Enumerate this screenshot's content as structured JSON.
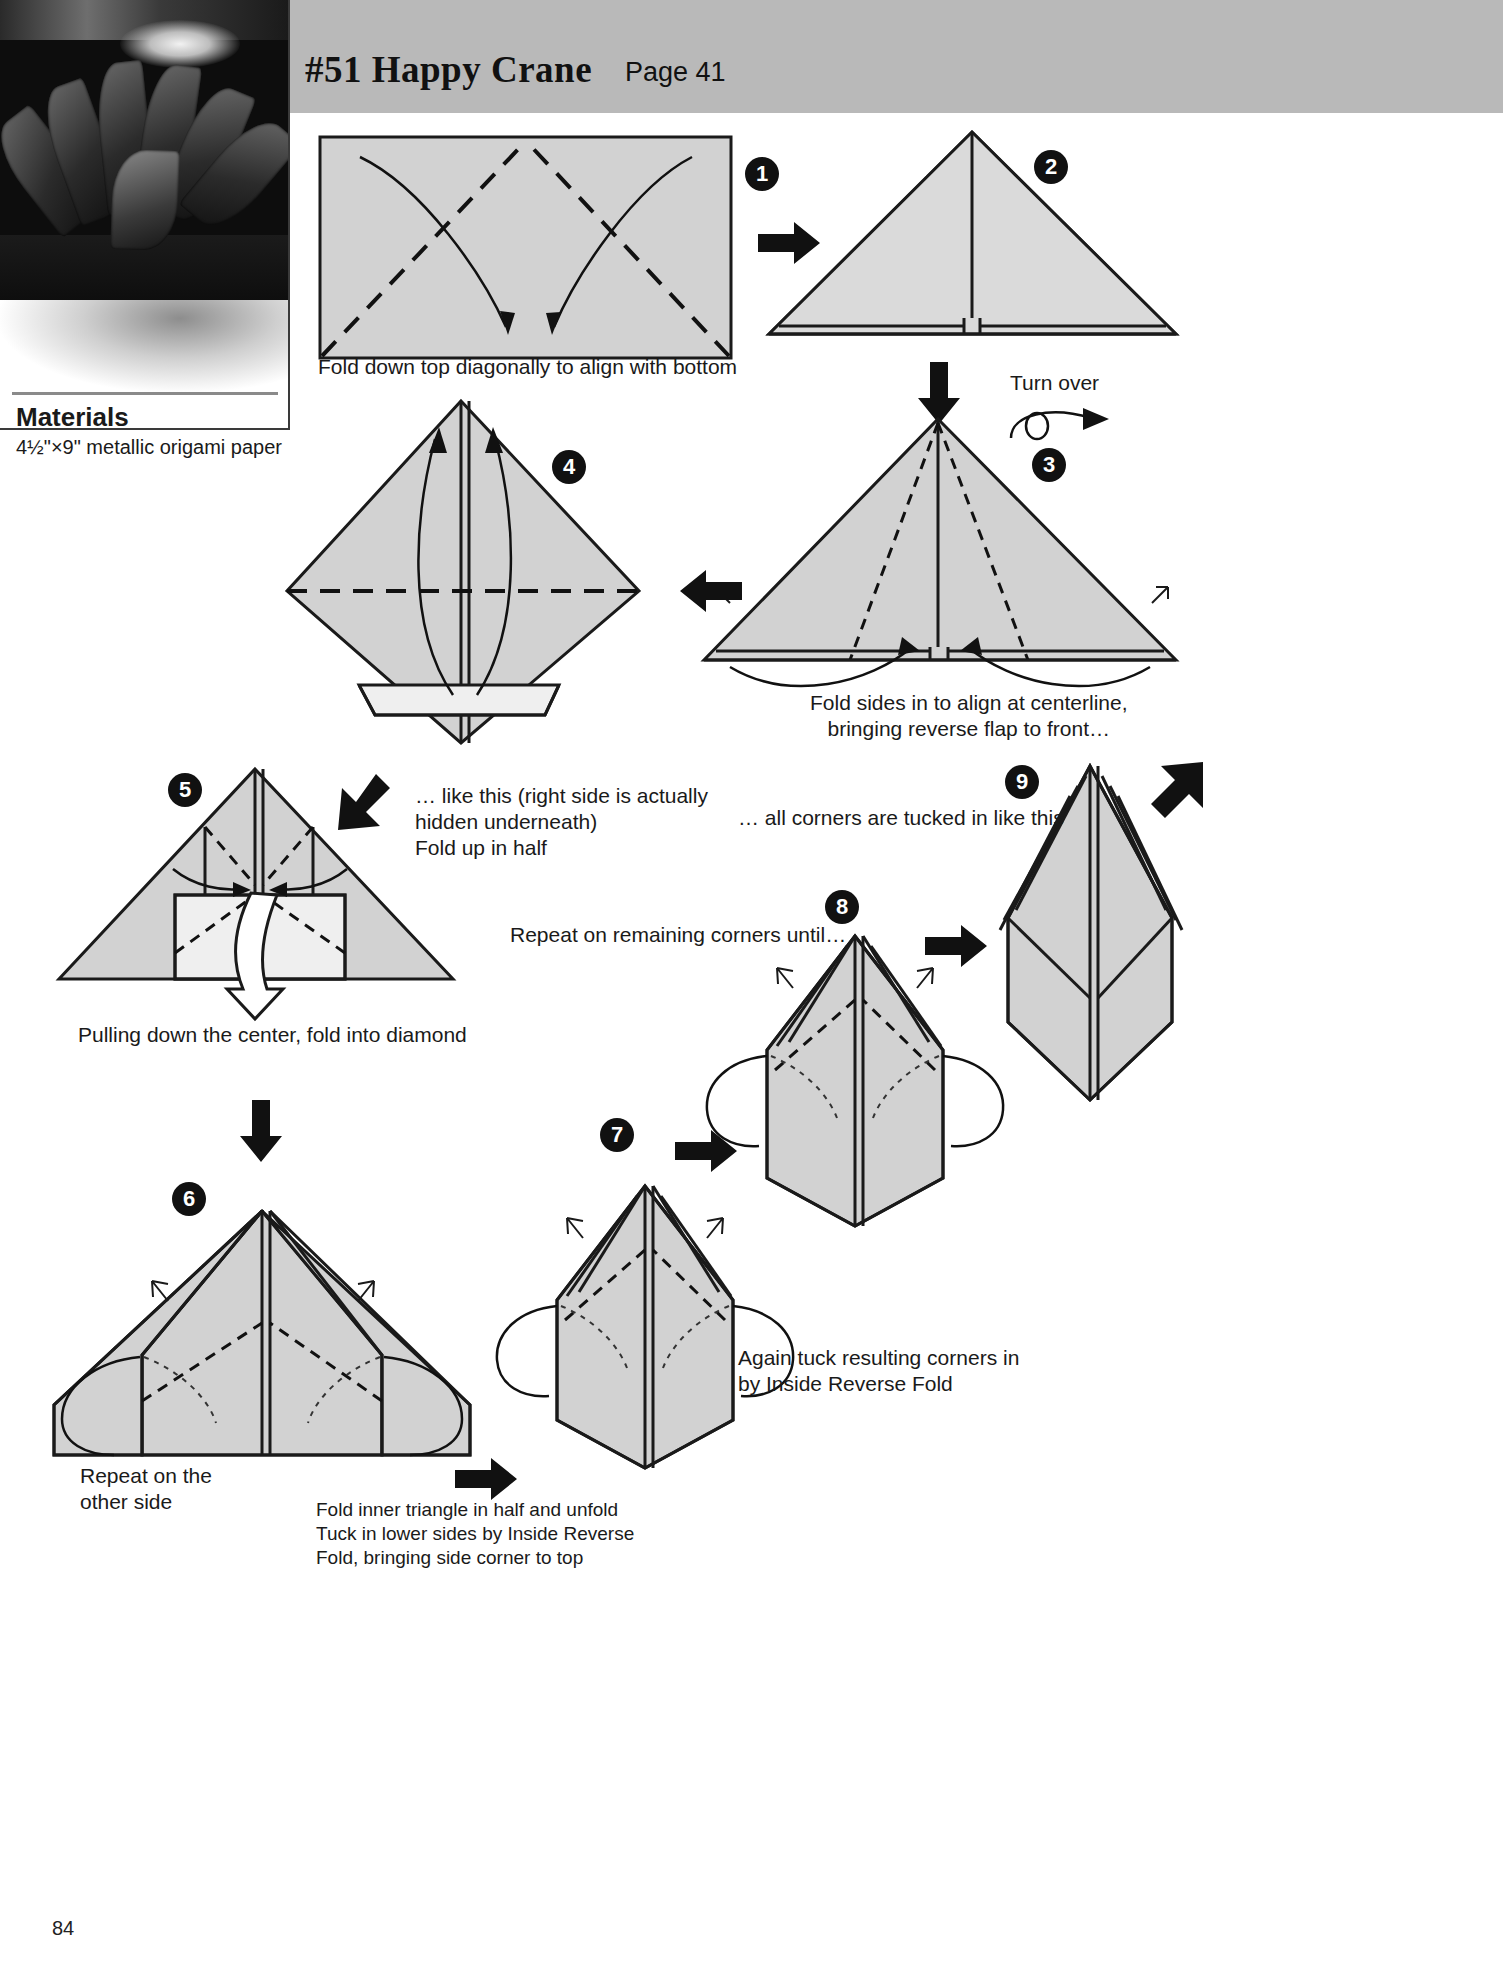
{
  "header": {
    "title": "#51 Happy Crane",
    "page_label": "Page 41"
  },
  "sidebar": {
    "photo_alt": "finished-origami-flower-photo",
    "materials_title": "Materials",
    "materials_spec": "4½\"×9\" metallic origami paper"
  },
  "page_number": "84",
  "steps": [
    {
      "num": "1",
      "marker": "❶",
      "caption": "Fold down top diagonally to align with bottom"
    },
    {
      "num": "2",
      "marker": "❷",
      "caption": ""
    },
    {
      "num": "3",
      "marker": "❸",
      "caption": "Fold sides in to align at centerline,\nbringing reverse flap to front…"
    },
    {
      "num": "4",
      "marker": "❹",
      "caption": "… like this (right side is actually\nhidden underneath)\nFold up in half"
    },
    {
      "num": "5",
      "marker": "❺",
      "caption": "Pulling down the center, fold into diamond"
    },
    {
      "num": "6",
      "marker": "❻",
      "caption": "Repeat on the\nother side"
    },
    {
      "num": "7",
      "marker": "❼",
      "caption": "Fold inner triangle in half and unfold\nTuck in lower sides by Inside Reverse\nFold, bringing side corner to top"
    },
    {
      "num": "8",
      "marker": "❽",
      "caption": "Again tuck resulting corners in\nby Inside Reverse Fold"
    },
    {
      "num": "9",
      "marker": "❾",
      "caption": "… all corners are tucked in like this"
    }
  ],
  "annotations": {
    "turn_over": "Turn over",
    "repeat_corners": "Repeat on remaining corners until…"
  },
  "colors": {
    "header_band": "#b9b9b9",
    "paper_fill": "#d2d2d2",
    "ink": "#1a1a1a",
    "step_badge": "#111111"
  }
}
